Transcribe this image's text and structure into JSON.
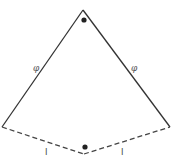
{
  "diagram": {
    "type": "kite-geometry",
    "colors": {
      "solid_edge": "#333333",
      "dashed_edge": "#444444",
      "dot": "#222222",
      "label": "#555555"
    },
    "vertices": {
      "apex": [
        83,
        10
      ],
      "left": [
        2,
        127
      ],
      "right": [
        170,
        127
      ],
      "bottom": [
        84,
        154
      ]
    },
    "points": {
      "top_dot": [
        84,
        20
      ],
      "bottom_dot": [
        85,
        147
      ]
    },
    "labels": {
      "left_edge": "φ",
      "right_edge": "φ",
      "bottom_left": "l",
      "bottom_right": "l"
    }
  }
}
